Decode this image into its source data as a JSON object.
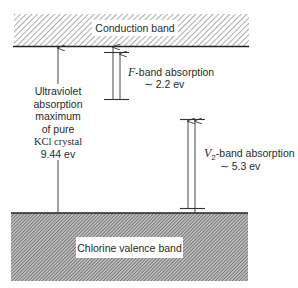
{
  "diagram": {
    "conduction_band": {
      "label": "Conduction band"
    },
    "valence_band": {
      "label": "Chlorine valence band"
    },
    "uv_absorption": {
      "lines": [
        "Ultraviolet",
        "absorption",
        "maximum",
        "of pure",
        "KCl crystal",
        "9.44 ev"
      ]
    },
    "f_band": {
      "symbol": "F",
      "label": "-band absorption",
      "energy": "∼ 2.2 ev"
    },
    "v2_band": {
      "symbol": "V",
      "subscript": "2",
      "label": "-band absorption",
      "energy": "∼ 5.3 ev"
    },
    "colors": {
      "line": "#333333",
      "hatch_light": "#555555",
      "hatch_dark": "#444444"
    }
  }
}
